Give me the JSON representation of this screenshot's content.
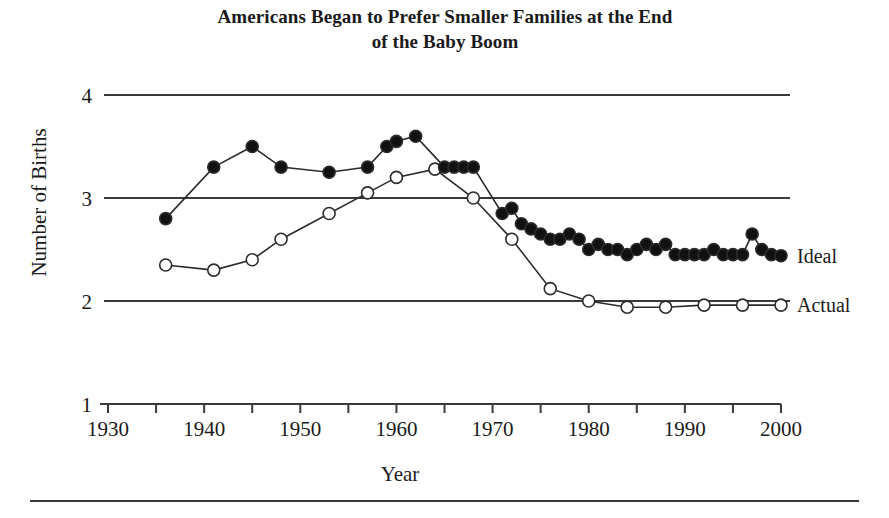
{
  "figure": {
    "title": "Americans Began to Prefer Smaller Families at the End of the Baby Boom",
    "title_line1": "Americans Began to Prefer Smaller Families at the End",
    "title_line2": "of the Baby Boom"
  },
  "axes": {
    "ylabel": "Number of Births",
    "xlabel": "Year",
    "ytick_labels": [
      "1",
      "2",
      "3",
      "4"
    ],
    "xtick_labels": [
      "1930",
      "1940",
      "1950",
      "1960",
      "1970",
      "1980",
      "1990",
      "2000"
    ]
  },
  "legend": {
    "ideal_label": "Ideal",
    "actual_label": "Actual"
  },
  "colors": {
    "line": "#2b2b2b",
    "grid": "#3a3a3a",
    "ideal_marker_fill": "#111111",
    "actual_marker_fill": "#ffffff",
    "text": "#1a1a1a",
    "background": "#ffffff"
  },
  "chart_data": {
    "type": "line",
    "title": "Americans Began to Prefer Smaller Families at the End of the Baby Boom",
    "xlabel": "Year",
    "ylabel": "Number of Births",
    "xlim": [
      1930,
      2000
    ],
    "ylim": [
      1,
      4
    ],
    "xticks": [
      1930,
      1940,
      1950,
      1960,
      1970,
      1980,
      1990,
      2000
    ],
    "xminor_ticks": [
      1935,
      1945,
      1955,
      1965,
      1975,
      1985,
      1995
    ],
    "yticks": [
      1,
      2,
      3,
      4
    ],
    "grid": "horizontal",
    "legend_position": "right-line-end",
    "series": [
      {
        "name": "Ideal",
        "marker": "filled-circle",
        "x": [
          1936,
          1941,
          1945,
          1948,
          1953,
          1957,
          1959,
          1960,
          1962,
          1965,
          1966,
          1967,
          1968,
          1971,
          1972,
          1973,
          1974,
          1975,
          1976,
          1977,
          1978,
          1979,
          1980,
          1981,
          1982,
          1983,
          1984,
          1985,
          1986,
          1987,
          1988,
          1989,
          1990,
          1991,
          1992,
          1993,
          1994,
          1995,
          1996,
          1997,
          1998,
          1999,
          2000
        ],
        "values": [
          2.8,
          3.3,
          3.5,
          3.3,
          3.25,
          3.3,
          3.5,
          3.55,
          3.6,
          3.3,
          3.3,
          3.3,
          3.3,
          2.85,
          2.9,
          2.75,
          2.7,
          2.65,
          2.6,
          2.6,
          2.65,
          2.6,
          2.5,
          2.55,
          2.5,
          2.5,
          2.45,
          2.5,
          2.55,
          2.5,
          2.55,
          2.45,
          2.45,
          2.45,
          2.45,
          2.5,
          2.45,
          2.45,
          2.45,
          2.65,
          2.5,
          2.45,
          2.44
        ]
      },
      {
        "name": "Actual",
        "marker": "open-circle",
        "x": [
          1936,
          1941,
          1945,
          1948,
          1953,
          1957,
          1960,
          1964,
          1968,
          1972,
          1976,
          1980,
          1984,
          1988,
          1992,
          1996,
          2000
        ],
        "values": [
          2.35,
          2.3,
          2.4,
          2.6,
          2.85,
          3.05,
          3.2,
          3.28,
          3.0,
          2.6,
          2.12,
          2.0,
          1.94,
          1.94,
          1.96,
          1.96,
          1.96
        ]
      }
    ]
  }
}
